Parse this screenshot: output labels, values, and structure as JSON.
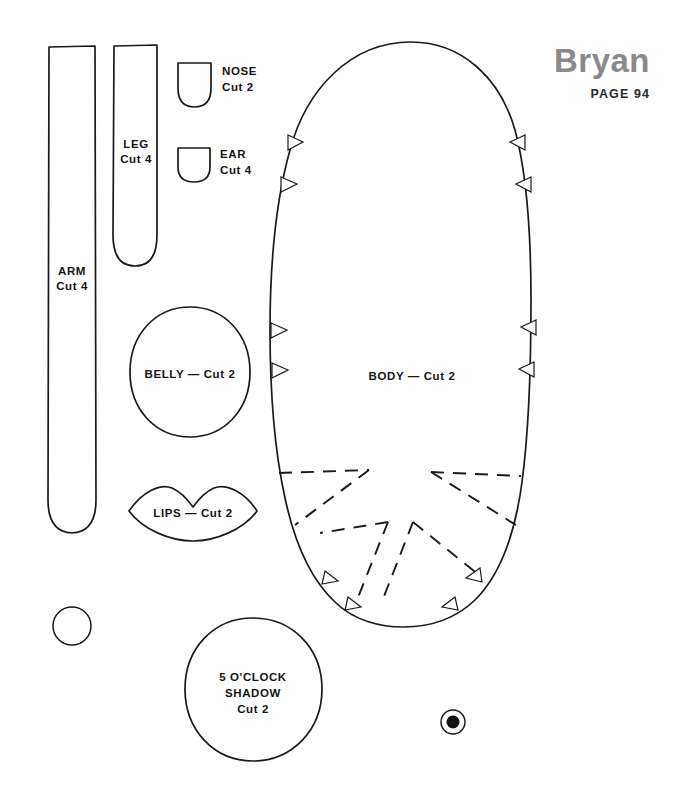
{
  "document": {
    "type": "sewing-pattern-sheet",
    "title": "Bryan",
    "page_label": "PAGE 94",
    "background_color": "#ffffff",
    "ink_color": "#1a1a1a",
    "title_color": "#8a8a8a"
  },
  "pieces": {
    "arm": {
      "name": "ARM",
      "cut": "Cut 4",
      "label_line1": "ARM",
      "label_line2": "Cut 4"
    },
    "leg": {
      "name": "LEG",
      "cut": "Cut 4",
      "label_line1": "LEG",
      "label_line2": "Cut 4"
    },
    "nose": {
      "name": "NOSE",
      "cut": "Cut 2",
      "label_line1": "NOSE",
      "label_line2": "Cut 2"
    },
    "ear": {
      "name": "EAR",
      "cut": "Cut 4",
      "label_line1": "EAR",
      "label_line2": "Cut 4"
    },
    "belly": {
      "name": "BELLY",
      "cut": "Cut 2",
      "label": "BELLY — Cut 2"
    },
    "lips": {
      "name": "LIPS",
      "cut": "Cut 2",
      "label": "LIPS — Cut 2"
    },
    "body": {
      "name": "BODY",
      "cut": "Cut 2",
      "label": "BODY — Cut 2"
    },
    "five_oclock_shadow": {
      "name": "5 O'CLOCK SHADOW",
      "cut": "Cut 2",
      "label_line1": "5 O'CLOCK",
      "label_line2": "SHADOW",
      "label_line3": "Cut 2"
    },
    "small_circle": {
      "name": "small circle piece",
      "label": ""
    },
    "eye_dot": {
      "name": "eye dot marking",
      "label": ""
    }
  }
}
